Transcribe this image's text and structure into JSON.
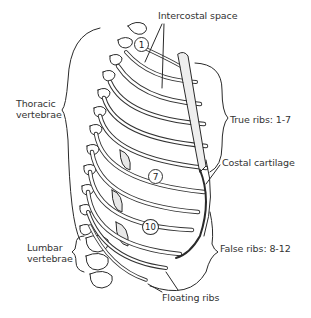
{
  "figure": {
    "colors": {
      "line": "#2a2a2a",
      "bone_fill": "#ffffff",
      "shade": "#9a9a9a",
      "background": "#ffffff"
    }
  },
  "labels": {
    "intercostal_space": "Intercostal space",
    "thoracic_vertebrae": [
      "Thoracic",
      "vertebrae"
    ],
    "true_ribs": "True ribs: 1-7",
    "costal_cartilage": "Costal cartilage",
    "lumbar_vertebrae": [
      "Lumbar",
      "vertebrae"
    ],
    "false_ribs": "False ribs: 8-12",
    "floating_ribs": "Floating ribs"
  },
  "rib_markers": [
    {
      "number": "1"
    },
    {
      "number": "7"
    },
    {
      "number": "10"
    }
  ]
}
